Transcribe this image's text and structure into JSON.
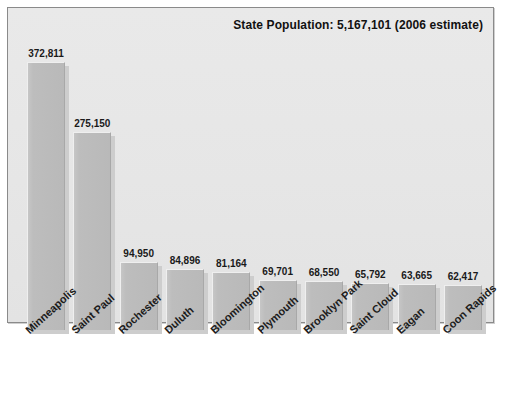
{
  "chart_data": {
    "type": "bar",
    "title": "State Population: 5,167,101 (2006 estimate)",
    "xlabel": "",
    "ylabel": "",
    "ylim": [
      0,
      400000
    ],
    "grid": false,
    "legend": "none",
    "value_label_format": "comma-separated integers above each bar",
    "categories": [
      "Minneapolis",
      "Saint Paul",
      "Rochester",
      "Duluth",
      "Bloomington",
      "Plymouth",
      "Brooklyn Park",
      "Saint Cloud",
      "Eagan",
      "Coon Rapids"
    ],
    "values": [
      372811,
      275150,
      94950,
      84896,
      81164,
      69701,
      68550,
      65792,
      63665,
      62417
    ],
    "value_labels": [
      "372,811",
      "275,150",
      "94,950",
      "84,896",
      "81,164",
      "69,701",
      "68,550",
      "65,792",
      "63,665",
      "62,417"
    ]
  },
  "colors": {
    "bar_fill": "#bdbdbd",
    "bar_highlight": "#efefef",
    "bar_shadow": "#cdcdcd",
    "plot_background": "#e6e6e6",
    "frame_border": "#8a8a8a",
    "text": "#1a1a1a",
    "page_background": "#ffffff"
  }
}
